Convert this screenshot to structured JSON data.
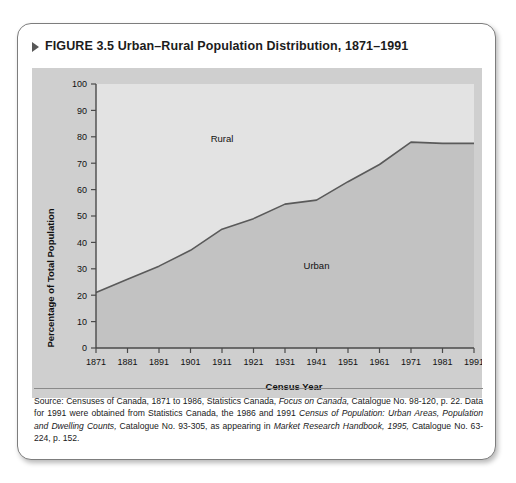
{
  "figure": {
    "bullet_icon": "triangle-right-icon",
    "title": "FIGURE 3.5 Urban–Rural Population Distribution, 1871–1991"
  },
  "source": {
    "label": "Source:",
    "text": "Censuses of Canada, 1871 to 1986, Statistics Canada, Focus on Canada, Catalogue No. 98-120, p. 22. Data for 1991 were obtained from Statistics Canada, the 1986 and 1991 Census of Population: Urban Areas, Population and Dwelling Counts, Catalogue No. 93-305, as appearing in Market Research Handbook, 1995, Catalogue No. 63-224, p. 152.",
    "segments": {
      "s1": "Censuses of Canada, 1871 to 1986, Statistics Canada,",
      "italic1": "Focus on Canada,",
      "s2": "Catalogue No. 98-120, p. 22. Data for 1991 were obtained from Statistics Canada, the 1986 and 1991",
      "italic2": "Census of Population: Urban Areas, Population and Dwelling Counts,",
      "s3": "Catalogue No. 93-305, as appearing in",
      "italic3": "Market Research Handbook, 1995,",
      "s4": "Catalogue No. 63-224, p. 152."
    }
  },
  "chart_data": {
    "type": "area",
    "title": "Urban–Rural Population Distribution, 1871–1991",
    "xlabel": "Census Year",
    "ylabel": "Percentage of Total Population",
    "xlim": [
      1871,
      1991
    ],
    "ylim": [
      0,
      100
    ],
    "grid": false,
    "legend_position": "inline-annotations",
    "x_ticks": [
      "1871",
      "1881",
      "1891",
      "1901",
      "1911",
      "1921",
      "1931",
      "1941",
      "1951",
      "1961",
      "1971",
      "1981",
      "1991"
    ],
    "y_ticks": [
      "0",
      "10",
      "20",
      "30",
      "40",
      "50",
      "60",
      "70",
      "80",
      "90",
      "100"
    ],
    "categories": [
      1871,
      1881,
      1891,
      1901,
      1911,
      1921,
      1931,
      1941,
      1951,
      1961,
      1971,
      1981,
      1991
    ],
    "series": [
      {
        "name": "Urban",
        "values": [
          21,
          26,
          31,
          37,
          45,
          49,
          54.5,
          56,
          63,
          69.5,
          78,
          77.5,
          77.5
        ],
        "fill_color": "#c2c2c2",
        "line_color": "#5a5a5a"
      },
      {
        "name": "Rural",
        "values": [
          79,
          74,
          69,
          63,
          55,
          51,
          45.5,
          44,
          37,
          30.5,
          22,
          22.5,
          22.5
        ],
        "fill_color": "#e3e3e3",
        "line_color": "#5a5a5a"
      }
    ],
    "annotations": [
      {
        "text": "Rural",
        "x": 1911,
        "y": 78
      },
      {
        "text": "Urban",
        "x": 1941,
        "y": 30
      }
    ],
    "colors": {
      "panel_background": "#cfcfcf",
      "plot_upper": "#e3e3e3",
      "plot_lower": "#c2c2c2",
      "axis": "#4a4a4a",
      "data_line": "#5a5a5a"
    }
  }
}
